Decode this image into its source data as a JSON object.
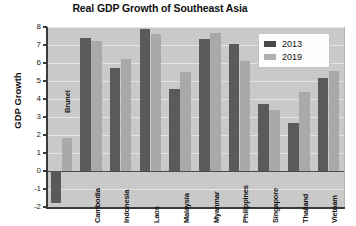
{
  "chart_data": {
    "type": "bar",
    "title": "Real GDP Growth of Southeast Asia",
    "xlabel": "",
    "ylabel": "GDP Growth",
    "ylim": [
      -2,
      8
    ],
    "yticks": [
      -2,
      -1,
      0,
      1,
      2,
      3,
      4,
      5,
      6,
      7,
      8
    ],
    "grid": true,
    "legend_position": "top-right",
    "categories": [
      "Brunei",
      "Cambodia",
      "Indonesia",
      "Laos",
      "Malaysia",
      "Myanmar",
      "Philippines",
      "Singapore",
      "Thailand",
      "Vietnam"
    ],
    "series": [
      {
        "name": "2013",
        "color": "#5a5a5a",
        "values": [
          -1.75,
          7.4,
          5.7,
          7.9,
          4.55,
          7.35,
          7.05,
          3.7,
          2.65,
          5.15
        ]
      },
      {
        "name": "2019",
        "color": "#a9a9a9",
        "values": [
          1.85,
          7.2,
          6.2,
          7.6,
          5.5,
          7.65,
          6.1,
          3.4,
          4.4,
          5.55
        ]
      }
    ]
  },
  "legend": {
    "entries": [
      {
        "label": "2013"
      },
      {
        "label": "2019"
      }
    ]
  },
  "colors": {
    "series_2013": "#5a5a5a",
    "series_2019": "#a9a9a9",
    "plot_background": "#c9c9c9",
    "gridline": "#e4e4e4",
    "axis": "#3a3a3a",
    "text": "#111111"
  }
}
